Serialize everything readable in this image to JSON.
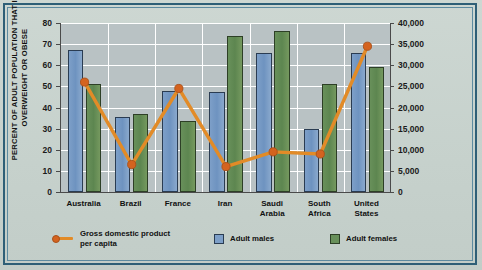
{
  "chart_data": {
    "type": "bar",
    "title": "",
    "categories": [
      "Australia",
      "Brazil",
      "France",
      "Iran",
      "Saudi Arabia",
      "South Africa",
      "United States"
    ],
    "series": [
      {
        "name": "Adult males",
        "type": "bar",
        "color": "#7d9fc8",
        "axis": "left",
        "values": [
          67,
          35.5,
          48,
          47.5,
          66,
          30,
          66
        ]
      },
      {
        "name": "Adult females",
        "type": "bar",
        "color": "#68905a",
        "axis": "left",
        "values": [
          51,
          37,
          33.5,
          74,
          76,
          51,
          59
        ]
      },
      {
        "name": "Gross domestic product per capita",
        "type": "line",
        "color": "#e28b27",
        "axis": "right",
        "values": [
          26000,
          6500,
          24500,
          6000,
          9500,
          9000,
          34500
        ]
      }
    ],
    "xlabel": "",
    "ylabel": "PERCENT OF ADULT POPULATION THAT IS OVERWEIGHT OR OBESE",
    "y2label": "GDP PER CAPITA IN U.S. DOLLARS",
    "ylim": [
      0,
      80
    ],
    "y2lim": [
      0,
      40000
    ],
    "yticks": [
      "80",
      "70",
      "60",
      "50",
      "40",
      "30",
      "20",
      "10",
      "0"
    ],
    "y2ticks": [
      "40,000",
      "35,000",
      "30,000",
      "25,000",
      "20,000",
      "15,000",
      "10,000",
      "5,000",
      "0"
    ],
    "grid": true,
    "legend_position": "bottom"
  },
  "axes": {
    "left_title": "PERCENT OF ADULT POPULATION THAT IS OVERWEIGHT OR OBESE",
    "left_title_line1": "PERCENT OF ADULT POPULATION THAT IS",
    "left_title_line2": "OVERWEIGHT OR OBESE",
    "right_title": "GDP PER CAPITA IN U.S. DOLLARS"
  },
  "x_labels": [
    {
      "line1": "Australia",
      "line2": ""
    },
    {
      "line1": "Brazil",
      "line2": ""
    },
    {
      "line1": "France",
      "line2": ""
    },
    {
      "line1": "Iran",
      "line2": ""
    },
    {
      "line1": "Saudi",
      "line2": "Arabia"
    },
    {
      "line1": "South",
      "line2": "Africa"
    },
    {
      "line1": "United",
      "line2": "States"
    }
  ],
  "legend": {
    "gdp_line1": "Gross domestic product",
    "gdp_line2": "per capita",
    "males": "Adult males",
    "females": "Adult females"
  },
  "colors": {
    "male_bar": "#7d9fc8",
    "female_bar": "#68905a",
    "gdp_line": "#e28b27",
    "gdp_marker": "#d4631f",
    "frame": "#2e5f77",
    "plot_bg": "#b9c2c4",
    "page_bg": "#c9d4cf"
  }
}
